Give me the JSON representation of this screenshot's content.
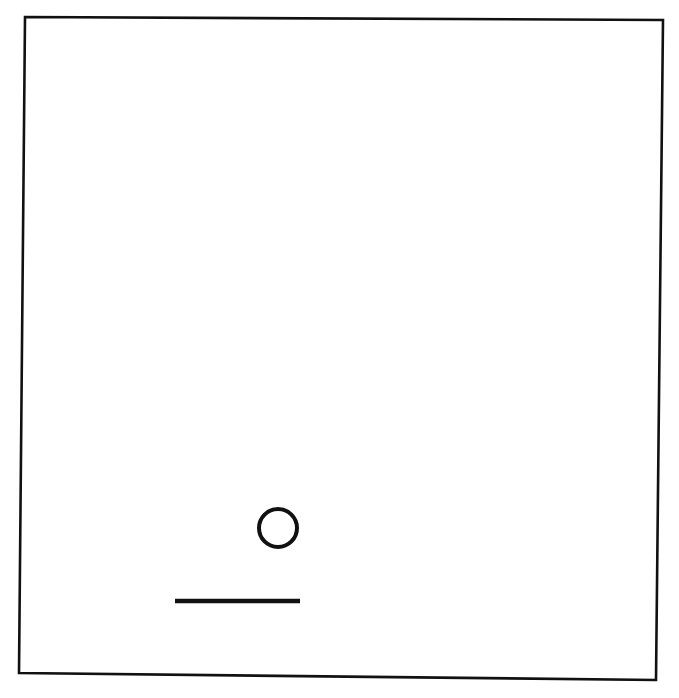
{
  "figure": {
    "canvas": {
      "width": 679,
      "height": 698,
      "background_color": "#ffffff",
      "ink_color": "#111111"
    },
    "shapes": [
      {
        "name": "panel-border",
        "type": "rectangle-outline",
        "stroke_color": "#111111",
        "stroke_width": 2.6,
        "fill": "none",
        "points": [
          {
            "x": 25,
            "y": 17
          },
          {
            "x": 663,
            "y": 20
          },
          {
            "x": 656,
            "y": 680
          },
          {
            "x": 19,
            "y": 673
          }
        ]
      },
      {
        "name": "circle-mark",
        "type": "circle-outline",
        "stroke_color": "#111111",
        "stroke_width": 4,
        "fill": "none",
        "center_x": 278,
        "center_y": 528,
        "radius": 19
      },
      {
        "name": "line-mark",
        "type": "line-segment",
        "stroke_color": "#111111",
        "stroke_width": 4.5,
        "x1": 175,
        "y1": 601,
        "x2": 300,
        "y2": 601
      }
    ]
  }
}
